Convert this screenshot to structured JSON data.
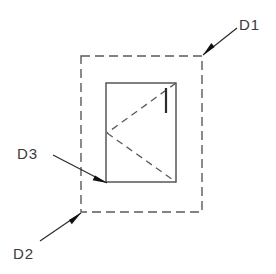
{
  "diagram": {
    "canvas": {
      "width": 276,
      "height": 274,
      "background": "#ffffff"
    },
    "colors": {
      "outline": "#4a4a4a",
      "dashed": "#5a5a5a",
      "leader": "#2b2b2b",
      "text": "#3a3a3a"
    },
    "outer_boundary": {
      "name": "outer-dashed-rectangle",
      "shape": "rectangle",
      "style": "dashed",
      "x": 81,
      "y": 56,
      "width": 121,
      "height": 156,
      "dash": "9 5"
    },
    "inner_part": {
      "name": "inner-solid-rectangle",
      "shape": "rectangle",
      "style": "solid",
      "x": 106,
      "y": 83,
      "width": 70,
      "height": 99
    },
    "internal_lines": [
      {
        "name": "dashed-diagonal-upper",
        "style": "dashed",
        "x1": 176,
        "y1": 83,
        "x2": 107,
        "y2": 133
      },
      {
        "name": "dashed-diagonal-lower",
        "style": "dashed",
        "x1": 107,
        "y1": 133,
        "x2": 176,
        "y2": 182
      },
      {
        "name": "solid-tick-mark",
        "style": "solid",
        "x1": 166,
        "y1": 88,
        "x2": 166,
        "y2": 113
      }
    ],
    "callouts": [
      {
        "id": "D1",
        "label": "D1",
        "target": "outer-dashed-rectangle-top-right-corner",
        "leader": {
          "x1": 237,
          "y1": 28,
          "x2": 203,
          "y2": 55
        },
        "arrow_at": {
          "x": 203,
          "y": 55
        },
        "text_pos": {
          "x": 239,
          "y": 30
        },
        "text_anchor": "start"
      },
      {
        "id": "D2",
        "label": "D2",
        "target": "outer-dashed-rectangle-bottom-left-corner",
        "leader": {
          "x1": 40,
          "y1": 241,
          "x2": 81,
          "y2": 213
        },
        "arrow_at": {
          "x": 81,
          "y": 213
        },
        "text_pos": {
          "x": 13,
          "y": 259
        },
        "text_anchor": "start"
      },
      {
        "id": "D3",
        "label": "D3",
        "target": "inner-solid-rectangle-bottom-left-corner",
        "leader": {
          "x1": 53,
          "y1": 155,
          "x2": 107,
          "y2": 183
        },
        "arrow_at": {
          "x": 107,
          "y": 183
        },
        "text_pos": {
          "x": 17,
          "y": 159
        },
        "text_anchor": "start"
      }
    ]
  }
}
